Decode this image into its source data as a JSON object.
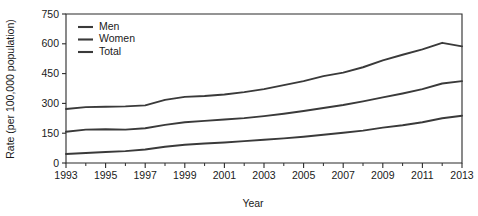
{
  "chart_data": {
    "type": "line",
    "title": "",
    "xlabel": "Year",
    "ylabel": "Rate (per 100,000 population)",
    "xlim": [
      1993,
      2013
    ],
    "ylim": [
      0,
      750
    ],
    "grid": false,
    "legend_position": "top-left",
    "x": [
      1993,
      1994,
      1995,
      1996,
      1997,
      1998,
      1999,
      2000,
      2001,
      2002,
      2003,
      2004,
      2005,
      2006,
      2007,
      2008,
      2009,
      2010,
      2011,
      2012,
      2013
    ],
    "xticklabels": [
      "1993",
      "1995",
      "1997",
      "1999",
      "2001",
      "2003",
      "2005",
      "2007",
      "2009",
      "2011",
      "2013"
    ],
    "xticks_major": [
      1993,
      1995,
      1997,
      1999,
      2001,
      2003,
      2005,
      2007,
      2009,
      2011,
      2013
    ],
    "xticks_minor": [
      1994,
      1996,
      1998,
      2000,
      2002,
      2004,
      2006,
      2008,
      2010,
      2012
    ],
    "yticks": [
      0,
      150,
      300,
      450,
      600,
      750
    ],
    "yticklabels": [
      "0",
      "150",
      "300",
      "450",
      "600",
      "750"
    ],
    "series": [
      {
        "name": "Men",
        "values": [
          272,
          281,
          283,
          285,
          290,
          318,
          333,
          337,
          345,
          357,
          372,
          392,
          412,
          437,
          455,
          482,
          517,
          545,
          572,
          605,
          587
        ]
      },
      {
        "name": "Women",
        "values": [
          157,
          168,
          170,
          168,
          175,
          192,
          205,
          212,
          219,
          226,
          236,
          248,
          262,
          277,
          292,
          310,
          330,
          350,
          372,
          400,
          412
        ]
      },
      {
        "name": "Total",
        "values": [
          45,
          50,
          55,
          60,
          68,
          82,
          92,
          98,
          103,
          110,
          117,
          124,
          132,
          142,
          152,
          163,
          178,
          190,
          205,
          225,
          238
        ]
      }
    ],
    "legend": [
      "Men",
      "Women",
      "Total"
    ],
    "colors": {
      "line": "#3a3a3a",
      "axis": "#2b2b2b",
      "background": "#ffffff",
      "text": "#1a1a1a"
    }
  }
}
